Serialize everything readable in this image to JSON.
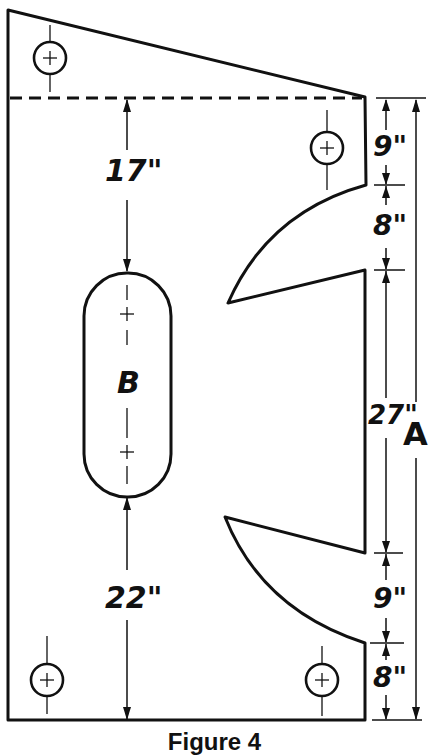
{
  "figure": {
    "caption": "Figure 4",
    "slot_label": "B",
    "overall_label": "A"
  },
  "dimensions": {
    "top_to_slot": "17\"",
    "slot_to_bottom": "22\"",
    "right_side": [
      {
        "id": "top_segment",
        "value": "9\""
      },
      {
        "id": "upper_notch",
        "value": "8\""
      },
      {
        "id": "middle_span",
        "value": "27\""
      },
      {
        "id": "lower_notch",
        "value": "9\""
      },
      {
        "id": "bottom_segment",
        "value": "8\""
      }
    ]
  },
  "colors": {
    "line": "#111111",
    "background": "#ffffff"
  }
}
